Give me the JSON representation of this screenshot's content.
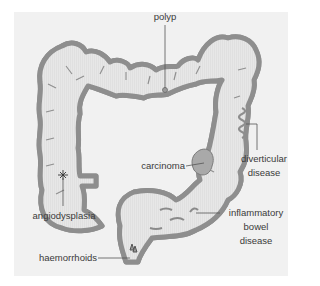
{
  "figure": {
    "colors": {
      "background": "#ffffff",
      "panel": "#f1f1f1",
      "wall_outer": "#8e8e8e",
      "wall_fill": "#c9c9c9",
      "lumen": "#e6e6e6",
      "leader_line": "#555555",
      "text": "#3a3a3a"
    },
    "labels": {
      "polyp": "polyp",
      "carcinoma": "carcinoma",
      "diverticular_line1": "diverticular",
      "diverticular_line2": "disease",
      "angiodysplasia": "angiodysplasia",
      "ibd_line1": "inflammatory",
      "ibd_line2": "bowel",
      "ibd_line3": "disease",
      "haemorrhoids": "haemorrhoids"
    }
  }
}
